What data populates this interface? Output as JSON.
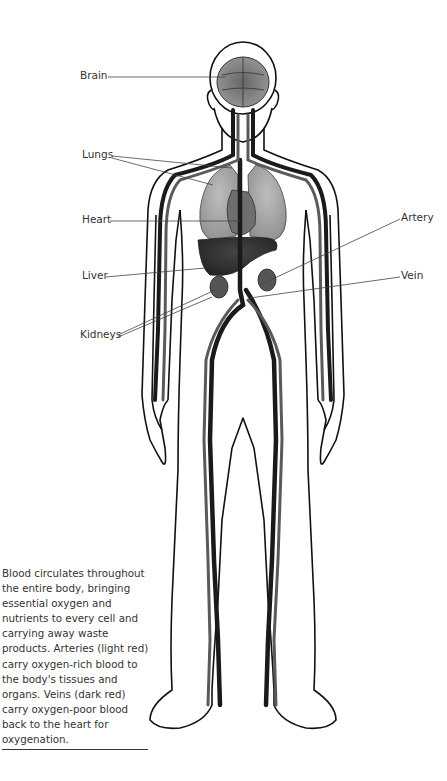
{
  "labels": {
    "brain": "Brain",
    "lungs": "Lungs",
    "heart": "Heart",
    "liver": "Liver",
    "kidneys": "Kidneys",
    "artery": "Artery",
    "vein": "Vein"
  },
  "caption": "Blood circulates throughout the entire body, bringing essential oxygen and nutrients to every cell and carrying away waste products. Arteries (light red) carry oxygen-rich blood to the body's tissues and organs. Veins (dark red) carry oxygen-poor blood back to the heart for oxygenation.",
  "colors": {
    "outline": "#111111",
    "vein": "#1a1a1a",
    "artery": "#5a5a5a",
    "organ": "#8a8a8a",
    "label_text": "#333333"
  }
}
